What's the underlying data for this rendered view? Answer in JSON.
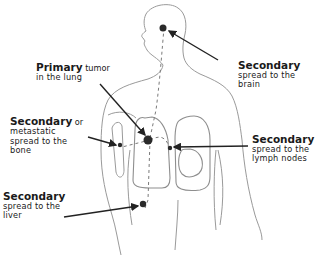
{
  "diagram": {
    "labels": {
      "primary": {
        "bold": "Primary",
        "rest": " tumor",
        "line2": "in the lung"
      },
      "brain": {
        "bold": "Secondary",
        "line2": "spread to the",
        "line3": "brain"
      },
      "bone": {
        "bold": "Secondary",
        "rest": " or",
        "line2": "metastatic",
        "line3": "spread to the",
        "line4": "bone"
      },
      "lymph": {
        "bold": "Secondary",
        "line2": "spread to the",
        "line3": "lymph nodes"
      },
      "liver": {
        "bold": "Secondary",
        "line2": "spread to the",
        "line3": "liver"
      }
    },
    "colors": {
      "outline": "#9a9a9a",
      "arrow": "#222222",
      "tumor": "#2a2a2a"
    }
  }
}
